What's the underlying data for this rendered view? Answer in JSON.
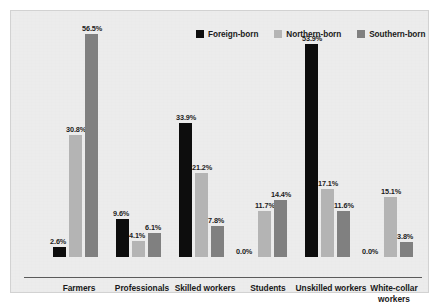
{
  "chart_data": {
    "type": "bar",
    "title": "",
    "subtitle": "",
    "xlabel": "",
    "ylabel": "",
    "ylim": [
      0,
      60
    ],
    "grid": false,
    "legend_position": "top-right",
    "value_suffix": "%",
    "categories": [
      "Farmers",
      "Professionals",
      "Skilled workers",
      "Students",
      "Unskilled workers",
      "White-collar workers"
    ],
    "category_lines": [
      [
        "Farmers"
      ],
      [
        "Professionals"
      ],
      [
        "Skilled workers"
      ],
      [
        "Students"
      ],
      [
        "Unskilled workers"
      ],
      [
        "White-collar",
        "workers"
      ]
    ],
    "series": [
      {
        "name": "Foreign-born",
        "color": "#0d0d0d",
        "values": [
          2.6,
          9.6,
          33.9,
          0.0,
          53.9,
          0.0
        ],
        "labels": [
          "2.6%",
          "9.6%",
          "33.9%",
          "0.0%",
          "53.9%",
          "0.0%"
        ]
      },
      {
        "name": "Northern-born",
        "color": "#b4b4b4",
        "values": [
          30.8,
          4.1,
          21.2,
          11.7,
          17.1,
          15.1
        ],
        "labels": [
          "30.8%",
          "4.1%",
          "21.2%",
          "11.7%",
          "17.1%",
          "15.1%"
        ]
      },
      {
        "name": "Southern-born",
        "color": "#808080",
        "values": [
          56.5,
          6.1,
          7.8,
          14.4,
          11.6,
          3.8
        ],
        "labels": [
          "56.5%",
          "6.1%",
          "7.8%",
          "14.4%",
          "11.6%",
          "3.8%"
        ]
      }
    ]
  },
  "legend": {
    "items": [
      {
        "label": "Foreign-born",
        "color": "#0d0d0d"
      },
      {
        "label": "Northern-born",
        "color": "#b4b4b4"
      },
      {
        "label": "Southern-born",
        "color": "#808080"
      }
    ]
  },
  "style": {
    "panel_background": "#ececec",
    "axis_color": "#5a5a5a",
    "text_color": "#1a1a1a"
  }
}
